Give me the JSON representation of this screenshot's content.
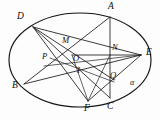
{
  "figure": {
    "conic_label": "α",
    "stroke_color": "#141414",
    "background_color": "#fdfdfd",
    "ellipse": {
      "cx": 80,
      "cy": 60,
      "rx": 71,
      "ry": 47
    },
    "vertex_labels": {
      "A": "A",
      "B": "B",
      "C": "C",
      "D": "D",
      "E": "E",
      "F": "F",
      "I": "I",
      "M": "M",
      "N": "N",
      "O": "O",
      "P": "P",
      "Q": "Q",
      "alpha": "α"
    },
    "points": [
      {
        "name": "A",
        "label": "A",
        "x": 110,
        "y": 17,
        "label_x": 108,
        "label_y": 3,
        "on_curve": true
      },
      {
        "name": "D",
        "label": "D",
        "x": 33,
        "y": 27,
        "label_x": 18,
        "label_y": 13,
        "on_curve": true
      },
      {
        "name": "E",
        "label": "E",
        "x": 141,
        "y": 55,
        "label_x": 146,
        "label_y": 48,
        "on_curve": true
      },
      {
        "name": "B",
        "label": "B",
        "x": 24,
        "y": 84,
        "label_x": 13,
        "label_y": 84,
        "on_curve": true
      },
      {
        "name": "F",
        "label": "F",
        "x": 88,
        "y": 101,
        "label_x": 84,
        "label_y": 105,
        "on_curve": true
      },
      {
        "name": "C",
        "label": "C",
        "x": 110,
        "y": 98,
        "label_x": 108,
        "label_y": 103,
        "on_curve": true
      },
      {
        "name": "M",
        "label": "M",
        "x": 67,
        "y": 46,
        "label_x": 63,
        "label_y": 37,
        "on_curve": false
      },
      {
        "name": "N",
        "label": "N",
        "x": 110,
        "y": 55,
        "label_x": 112,
        "label_y": 44,
        "on_curve": false
      },
      {
        "name": "O",
        "label": "O",
        "x": 79,
        "y": 61,
        "label_x": 74,
        "label_y": 55,
        "on_curve": false
      },
      {
        "name": "P",
        "label": "P",
        "x": 53,
        "y": 61,
        "label_x": 43,
        "label_y": 53,
        "on_curve": false
      },
      {
        "name": "I",
        "label": "I",
        "x": 82,
        "y": 74,
        "label_x": 78,
        "label_y": 68,
        "on_curve": false
      },
      {
        "name": "Q",
        "label": "Q",
        "x": 114,
        "y": 80,
        "label_x": 111,
        "label_y": 73,
        "on_curve": false
      }
    ],
    "segments": [
      {
        "name": "segment-A-C",
        "from": "A",
        "to": "C"
      },
      {
        "name": "segment-A-B",
        "from": "A",
        "to": "B"
      },
      {
        "name": "segment-D-C",
        "from": "D",
        "to": "C"
      },
      {
        "name": "segment-D-F",
        "from": "D",
        "to": "F"
      },
      {
        "name": "segment-D-E",
        "from": "D",
        "to": "E"
      },
      {
        "name": "segment-D-Q",
        "from": "D",
        "to": "Q"
      },
      {
        "name": "segment-B-E",
        "from": "B",
        "to": "E"
      },
      {
        "name": "segment-P-E",
        "from": "P",
        "to": "E"
      },
      {
        "name": "segment-O-E",
        "from": "O",
        "to": "E"
      },
      {
        "name": "segment-F-E",
        "from": "F",
        "to": "E"
      },
      {
        "name": "segment-F-N",
        "from": "F",
        "to": "N"
      },
      {
        "name": "segment-F-O",
        "from": "F",
        "to": "O"
      },
      {
        "name": "segment-P-I",
        "from": "P",
        "to": "I"
      },
      {
        "name": "segment-P-C",
        "from": "P",
        "to": "C"
      },
      {
        "name": "segment-O-horizontal",
        "from": "O",
        "to": "E"
      }
    ]
  }
}
